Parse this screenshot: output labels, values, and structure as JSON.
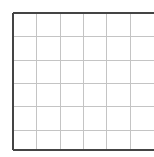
{
  "grid": {
    "origin": {
      "x": 13,
      "y": 13
    },
    "cell_size": 23.3,
    "columns": 6,
    "rows": 6,
    "right_edge": 154,
    "bottom": 150,
    "border_color": "#444444",
    "border_width": 2,
    "line_color": "#c4c4c4",
    "line_width": 1,
    "background": "#ffffff",
    "open_right": true
  }
}
